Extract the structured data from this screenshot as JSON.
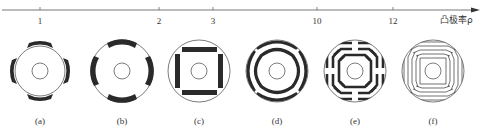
{
  "axis": {
    "title": "凸极率ρ",
    "ticks": [
      {
        "label": "1",
        "x": 40
      },
      {
        "label": "2",
        "x": 159
      },
      {
        "label": "3",
        "x": 213
      },
      {
        "label": "10",
        "x": 317
      },
      {
        "label": "12",
        "x": 393
      }
    ]
  },
  "figures": [
    {
      "id": "a",
      "caption": "(a)",
      "cx": 40,
      "description": "surface-mounted magnet rotor, 4 arc magnets outside circle"
    },
    {
      "id": "b",
      "caption": "(b)",
      "cx": 122,
      "description": "inset magnet rotor, 4 arc magnets inset in rim"
    },
    {
      "id": "c",
      "caption": "(c)",
      "cx": 199,
      "description": "interior magnet rotor, 4 rectangular bars forming square"
    },
    {
      "id": "d",
      "caption": "(d)",
      "cx": 277,
      "description": "double-layer arc flux barriers"
    },
    {
      "id": "e",
      "caption": "(e)",
      "cx": 355,
      "description": "multi-layer segmented flux barriers"
    },
    {
      "id": "f",
      "caption": "(f)",
      "cx": 433,
      "description": "axially laminated multi-layer rotor"
    }
  ],
  "colors": {
    "ink": "#2a2a2a",
    "line": "#555555"
  }
}
